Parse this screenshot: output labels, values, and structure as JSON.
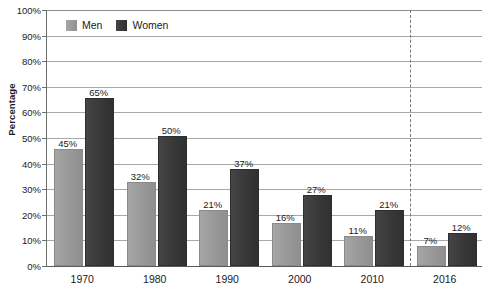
{
  "chart_data": {
    "type": "bar",
    "title": "",
    "xlabel": "",
    "ylabel": "Percentage",
    "ylim": [
      0,
      100
    ],
    "grid": true,
    "legend_position": "top-left-inside",
    "categories": [
      "1970",
      "1980",
      "1990",
      "2000",
      "2010",
      "2016"
    ],
    "series": [
      {
        "name": "Men",
        "color": "#9a9a9a",
        "values": [
          45,
          32,
          21,
          16,
          11,
          7
        ],
        "labels": [
          "45%",
          "32%",
          "21%",
          "16%",
          "11%",
          "7%"
        ]
      },
      {
        "name": "Women",
        "color": "#3a3a3a",
        "values": [
          65,
          50,
          37,
          27,
          21,
          12
        ],
        "labels": [
          "65%",
          "50%",
          "37%",
          "27%",
          "21%",
          "12%"
        ]
      }
    ],
    "y_ticks": [
      0,
      10,
      20,
      30,
      40,
      50,
      60,
      70,
      80,
      90,
      100
    ],
    "y_tick_labels": [
      "0%",
      "10%",
      "20%",
      "30%",
      "40%",
      "50%",
      "60%",
      "70%",
      "80%",
      "90%",
      "100%"
    ],
    "annotations": [
      {
        "type": "vertical-dashed-line",
        "name": "forecast-separator",
        "after_category": "2010",
        "color": "#777777"
      }
    ]
  },
  "legend": {
    "items": [
      {
        "label": "Men",
        "swatch": "men"
      },
      {
        "label": "Women",
        "swatch": "women"
      }
    ]
  }
}
